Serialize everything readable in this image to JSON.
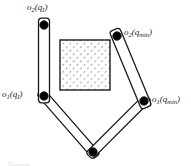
{
  "figure": {
    "width": 191,
    "height": 166,
    "background_color": "#ffffff",
    "stroke_color": "#1a1a1a",
    "joint_fill_color": "#000000",
    "link_fill_color": "#ffffff",
    "obstacle_hatch_color": "#555555"
  },
  "labels": {
    "top_left": {
      "text": "o2 (qI)",
      "base": "o",
      "base_sub": "2",
      "arg_open": "(",
      "arg_base": "q",
      "arg_sub": "I",
      "arg_close": ")"
    },
    "mid_left": {
      "text": "o1 (qI)",
      "base": "o",
      "base_sub": "1",
      "arg_open": "(",
      "arg_base": "q",
      "arg_sub": "I",
      "arg_close": ")"
    },
    "top_right": {
      "text": "o2 (qmin)",
      "base": "o",
      "base_sub": "2",
      "arg_open": "(",
      "arg_base": "q",
      "arg_sub": "min",
      "arg_close": ")"
    },
    "mid_right": {
      "text": "o1 (qmin)",
      "base": "o",
      "base_sub": "1",
      "arg_open": "(",
      "arg_base": "q",
      "arg_sub": "min",
      "arg_close": ")"
    }
  },
  "caption": {
    "text": "Figure"
  },
  "chart_data": {
    "type": "diagram",
    "coordinate_space": {
      "width": 191,
      "height": 166,
      "origin": "top-left",
      "y_axis": "down"
    },
    "joints": [
      {
        "name": "base-pivot",
        "x": 93,
        "y": 152,
        "radius": 4.2,
        "label": null
      },
      {
        "name": "o1-initial",
        "x": 44,
        "y": 96,
        "radius": 4.2,
        "label": "o1 (qI)"
      },
      {
        "name": "o2-initial",
        "x": 44,
        "y": 25,
        "radius": 4.2,
        "label": "o2 (qI)"
      },
      {
        "name": "o1-min",
        "x": 144,
        "y": 101,
        "radius": 4.2,
        "label": "o1 (qmin)"
      },
      {
        "name": "o2-min",
        "x": 117,
        "y": 36,
        "radius": 4.2,
        "label": "o2 (qmin)"
      }
    ],
    "links": [
      {
        "name": "link-initial-lower",
        "from": "base-pivot",
        "to": "o1-initial",
        "from_x": 93,
        "from_y": 152,
        "to_x": 44,
        "to_y": 96,
        "half_width": 4.5
      },
      {
        "name": "link-initial-upper",
        "from": "o1-initial",
        "to": "o2-initial",
        "from_x": 44,
        "from_y": 96,
        "to_x": 44,
        "to_y": 25,
        "half_width": 5.5
      },
      {
        "name": "link-min-lower",
        "from": "base-pivot",
        "to": "o1-min",
        "from_x": 93,
        "from_y": 152,
        "to_x": 144,
        "to_y": 101,
        "half_width": 4.5
      },
      {
        "name": "link-min-upper",
        "from": "o1-min",
        "to": "o2-min",
        "from_x": 144,
        "from_y": 101,
        "to_x": 117,
        "to_y": 36,
        "half_width": 5.5
      }
    ],
    "obstacle": {
      "name": "hatched-square-obstacle",
      "shape": "rectangle",
      "x": 60,
      "y": 40,
      "width": 50,
      "height": 50,
      "fill": "diagonal-hatch",
      "hatch_angle_deg": 45,
      "hatch_spacing": 5,
      "stroke": "#1a1a1a"
    },
    "label_positions": [
      {
        "key": "top_left",
        "x": 27,
        "y": 3,
        "anchor": "start"
      },
      {
        "key": "mid_left",
        "x": 2,
        "y": 90,
        "anchor": "start"
      },
      {
        "key": "top_right",
        "x": 124,
        "y": 28,
        "anchor": "start"
      },
      {
        "key": "mid_right",
        "x": 152,
        "y": 95,
        "anchor": "start"
      }
    ]
  }
}
